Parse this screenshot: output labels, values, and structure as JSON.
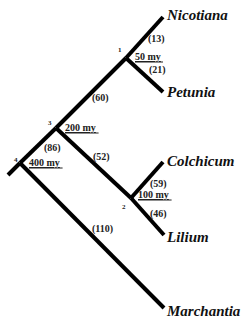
{
  "diagram": {
    "type": "phylogenetic-tree",
    "taxa": [
      {
        "name": "Nicotiana",
        "x": 167,
        "y": 20
      },
      {
        "name": "Petunia",
        "x": 167,
        "y": 97
      },
      {
        "name": "Colchicum",
        "x": 167,
        "y": 166
      },
      {
        "name": "Lilium",
        "x": 167,
        "y": 242
      },
      {
        "name": "Marchantia",
        "x": 167,
        "y": 316
      }
    ],
    "nodes": [
      {
        "id": "1",
        "age": "50 my",
        "id_x": 118,
        "id_y": 52,
        "age_x": 135,
        "age_y": 60
      },
      {
        "id": "2",
        "age": "100 my",
        "id_x": 122,
        "id_y": 209,
        "age_x": 138,
        "age_y": 198
      },
      {
        "id": "3",
        "age": "200 my",
        "id_x": 48,
        "id_y": 125,
        "age_x": 65,
        "age_y": 131
      },
      {
        "id": "4",
        "age": "400 my",
        "id_x": 14,
        "id_y": 162,
        "age_x": 29,
        "age_y": 166
      }
    ],
    "branch_lengths": [
      {
        "label": "(13)",
        "x": 148,
        "y": 42
      },
      {
        "label": "(21)",
        "x": 149,
        "y": 73
      },
      {
        "label": "(60)",
        "x": 92,
        "y": 101
      },
      {
        "label": "(86)",
        "x": 44,
        "y": 151
      },
      {
        "label": "(52)",
        "x": 93,
        "y": 160
      },
      {
        "label": "(59)",
        "x": 150,
        "y": 187
      },
      {
        "label": "(46)",
        "x": 150,
        "y": 217
      },
      {
        "label": "(110)",
        "x": 92,
        "y": 232
      }
    ],
    "branches": [
      {
        "from": "root",
        "x1": 8,
        "y1": 175,
        "x2": 20,
        "y2": 163
      },
      {
        "from": "node4-node3",
        "x1": 20,
        "y1": 163,
        "x2": 56,
        "y2": 128
      },
      {
        "from": "node3-node1",
        "x1": 56,
        "y1": 128,
        "x2": 126,
        "y2": 58
      },
      {
        "from": "node1-Nicotiana",
        "x1": 126,
        "y1": 58,
        "x2": 163,
        "y2": 17
      },
      {
        "from": "node1-Petunia",
        "x1": 126,
        "y1": 58,
        "x2": 163,
        "y2": 92
      },
      {
        "from": "node3-node2",
        "x1": 56,
        "y1": 128,
        "x2": 131,
        "y2": 198
      },
      {
        "from": "node2-Colchicum",
        "x1": 131,
        "y1": 198,
        "x2": 163,
        "y2": 162
      },
      {
        "from": "node2-Lilium",
        "x1": 131,
        "y1": 198,
        "x2": 164,
        "y2": 235
      },
      {
        "from": "node4-Marchantia",
        "x1": 20,
        "y1": 163,
        "x2": 164,
        "y2": 308
      }
    ]
  }
}
